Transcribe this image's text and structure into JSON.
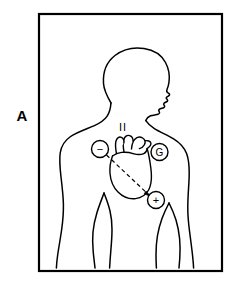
{
  "figure": {
    "panel_label": "A",
    "style": {
      "line_color": "#000000",
      "frame_color": "#000000",
      "background_color": "#ffffff",
      "frame_stroke_width": 2.2,
      "body_stroke_width": 1.5,
      "electrode_stroke_width": 1.4,
      "axis_stroke_width": 1.2
    },
    "frame": {
      "x": 39,
      "y": 14,
      "width": 183,
      "height": 257
    }
  },
  "lead_label": {
    "text": "II",
    "x": 123,
    "y": 127
  },
  "electrodes": [
    {
      "id": "negative-electrode",
      "symbol": "−",
      "polarity": "negative",
      "cx": 100,
      "cy": 149,
      "r": 8.5,
      "position_description": "right infraclavicular"
    },
    {
      "id": "ground-electrode",
      "symbol": "G",
      "polarity": "ground",
      "cx": 159.5,
      "cy": 152,
      "r": 8.5,
      "position_description": "left shoulder"
    },
    {
      "id": "positive-electrode",
      "symbol": "+",
      "polarity": "positive",
      "cx": 156,
      "cy": 200,
      "r": 8.5,
      "position_description": "left lower chest"
    }
  ],
  "cardiac_axis": {
    "id": "cardiac-axis-vector",
    "label": "lead II axis",
    "from": {
      "x": 106,
      "y": 155
    },
    "to": {
      "x": 150,
      "y": 196
    },
    "dash_pattern": "4,3",
    "arrow": true
  },
  "anatomy": {
    "body_outline_name": "torso-and-head-outline",
    "heart_name": "heart-outline",
    "orientation": "head in right profile, anterior torso view"
  }
}
